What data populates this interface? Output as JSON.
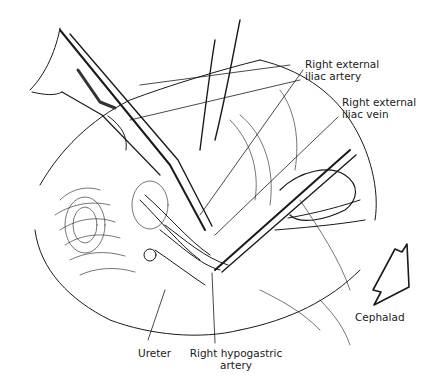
{
  "figure": {
    "colors": {
      "ink": "#1a1a1a",
      "background": "#ffffff"
    },
    "labels": {
      "right_external_iliac_artery": {
        "line1": "Right external",
        "line2": "iliac artery"
      },
      "right_external_iliac_vein": {
        "line1": "Right external",
        "line2": "iliac vein"
      },
      "ureter": {
        "line1": "Ureter"
      },
      "right_hypogastric_artery": {
        "line1": "Right hypogastric",
        "line2": "artery"
      },
      "cephalad": {
        "line1": "Cephalad"
      }
    },
    "orientation_arrow": {
      "icon": "hollow-arrow-icon",
      "direction": "down-left"
    }
  }
}
